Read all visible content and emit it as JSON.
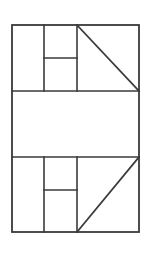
{
  "figure": {
    "background_color": "#ffffff",
    "stroke_color": "#3a3a3a",
    "canvas": {
      "width": 151,
      "height": 257
    },
    "outer_rect": {
      "name": "outer-rectangle",
      "left": 12,
      "top": 25,
      "right": 139,
      "bottom": 232,
      "width": 127,
      "height": 207
    },
    "horizontal_dividers": [
      {
        "name": "divider-upper",
        "y": 91,
        "x_start": 12,
        "x_end": 139
      },
      {
        "name": "divider-lower",
        "y": 157,
        "x_start": 12,
        "x_end": 139
      }
    ],
    "bands": [
      {
        "name": "top-band",
        "top": 25,
        "bottom": 91,
        "vertical_dividers": [
          {
            "name": "top-vertical-left",
            "x": 44,
            "y_start": 25,
            "y_end": 91
          },
          {
            "name": "top-vertical-right",
            "x": 77,
            "y_start": 25,
            "y_end": 91
          }
        ],
        "crossbar": {
          "name": "top-crossbar",
          "y": 58,
          "x_start": 44,
          "x_end": 77
        },
        "diagonal": {
          "name": "top-diagonal",
          "direction": "descending",
          "x1": 77,
          "y1": 25,
          "x2": 139,
          "y2": 91
        }
      },
      {
        "name": "middle-band",
        "top": 91,
        "bottom": 157,
        "vertical_dividers": [],
        "crossbar": null,
        "diagonal": null
      },
      {
        "name": "bottom-band",
        "top": 157,
        "bottom": 232,
        "vertical_dividers": [
          {
            "name": "bottom-vertical-left",
            "x": 44,
            "y_start": 157,
            "y_end": 232
          },
          {
            "name": "bottom-vertical-right",
            "x": 77,
            "y_start": 157,
            "y_end": 232
          }
        ],
        "crossbar": {
          "name": "bottom-crossbar",
          "y": 190,
          "x_start": 44,
          "x_end": 77
        },
        "diagonal": {
          "name": "bottom-diagonal",
          "direction": "ascending",
          "x1": 77,
          "y1": 232,
          "x2": 139,
          "y2": 157
        }
      }
    ]
  }
}
